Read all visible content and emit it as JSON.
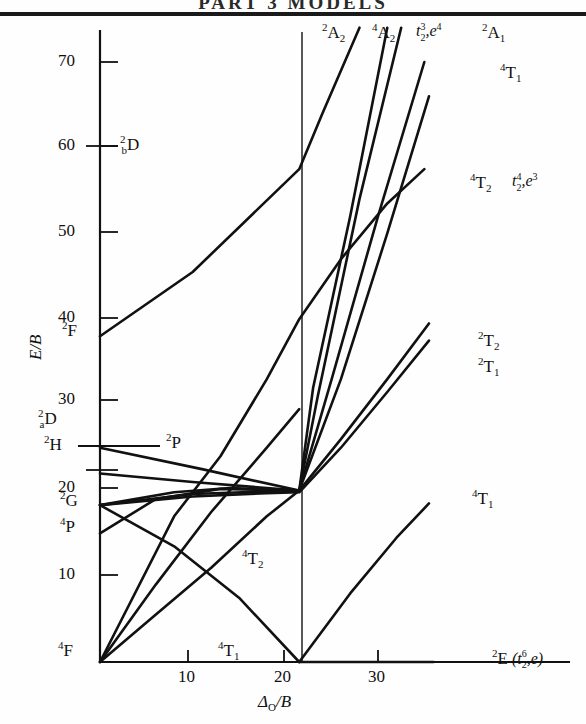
{
  "header": {
    "ghost_text": "PART 3   MODELS"
  },
  "chart_data": {
    "type": "line",
    "xlabel": "Δ_O/B",
    "ylabel": "E/B",
    "xlim": [
      0,
      36
    ],
    "ylim": [
      0,
      75
    ],
    "grid": false,
    "legend": "none",
    "xticks": [
      10,
      20,
      30
    ],
    "xtick_labels": [
      "10",
      "20",
      "30"
    ],
    "yticks": [
      10,
      20,
      30,
      40,
      50,
      60,
      70
    ],
    "ytick_labels": [
      "10",
      "20",
      "30",
      "40",
      "50",
      "60",
      "70"
    ],
    "crossover_x": 21.5,
    "free_ion_terms": [
      {
        "label": "2bD",
        "display_sup": "2",
        "display_sub": "b",
        "display_main": "D",
        "E": 60.0
      },
      {
        "label": "2F",
        "display_sup": "2",
        "display_sub": "",
        "display_main": "F",
        "E": 38.0
      },
      {
        "label": "2aD",
        "display_sup": "2",
        "display_sub": "a",
        "display_main": "D",
        "E": 25.0
      },
      {
        "label": "2H",
        "display_sup": "2",
        "display_sub": "",
        "display_main": "H",
        "E": 22.0
      },
      {
        "label": "2G",
        "display_sup": "2",
        "display_sub": "",
        "display_main": "G",
        "E": 18.3
      },
      {
        "label": "4P",
        "display_sup": "4",
        "display_sub": "",
        "display_main": "P",
        "E": 15.0
      },
      {
        "label": "4F",
        "display_sup": "4",
        "display_sub": "",
        "display_main": "F",
        "E": 0.0
      }
    ],
    "series": [
      {
        "name": "2A2-top",
        "points": [
          [
            0,
            18.3
          ],
          [
            8,
            19.8
          ],
          [
            14,
            20.3
          ],
          [
            21.5,
            20.0
          ],
          [
            23,
            32
          ],
          [
            27,
            52
          ],
          [
            31,
            74
          ]
        ]
      },
      {
        "name": "4A2-top",
        "points": [
          [
            0,
            15.0
          ],
          [
            6,
            19.0
          ],
          [
            13,
            20.2
          ],
          [
            21.5,
            20.0
          ],
          [
            23.5,
            31
          ],
          [
            28,
            54
          ],
          [
            32.5,
            74
          ]
        ]
      },
      {
        "name": "2F-line",
        "points": [
          [
            0,
            38.0
          ],
          [
            10,
            45.5
          ],
          [
            21.5,
            57.5
          ],
          [
            24,
            64
          ],
          [
            28,
            74
          ]
        ]
      },
      {
        "name": "2A1-line",
        "points": [
          [
            0,
            22.0
          ],
          [
            10,
            21.0
          ],
          [
            21.5,
            20.0
          ],
          [
            25,
            33
          ],
          [
            30,
            52
          ],
          [
            35,
            70
          ]
        ]
      },
      {
        "name": "4T1-upper",
        "points": [
          [
            0,
            25.0
          ],
          [
            11,
            22.5
          ],
          [
            21.5,
            20.0
          ],
          [
            26,
            33
          ],
          [
            31,
            50
          ],
          [
            35.5,
            66
          ]
        ]
      },
      {
        "name": "4T2-upper",
        "points": [
          [
            0,
            0.0
          ],
          [
            8,
            17.0
          ],
          [
            13,
            24.0
          ],
          [
            18,
            33.0
          ],
          [
            21.5,
            40.0
          ],
          [
            26,
            47
          ],
          [
            31,
            53.5
          ],
          [
            35,
            57.5
          ]
        ]
      },
      {
        "name": "2T2-line",
        "points": [
          [
            0,
            18.3
          ],
          [
            10,
            19.6
          ],
          [
            18,
            19.9
          ],
          [
            21.5,
            20.0
          ],
          [
            26,
            26
          ],
          [
            31,
            33
          ],
          [
            35.5,
            39.5
          ]
        ]
      },
      {
        "name": "2T1-line",
        "points": [
          [
            0,
            18.3
          ],
          [
            10,
            19.3
          ],
          [
            18,
            19.7
          ],
          [
            21.5,
            19.8
          ],
          [
            26,
            25
          ],
          [
            31,
            31.5
          ],
          [
            35.5,
            37.5
          ]
        ]
      },
      {
        "name": "4T2-lower",
        "points": [
          [
            0,
            0.0
          ],
          [
            6,
            9.0
          ],
          [
            12,
            17.5
          ],
          [
            18,
            25.0
          ],
          [
            21.5,
            29.5
          ]
        ]
      },
      {
        "name": "4T1-ground",
        "points": [
          [
            0,
            0.0
          ],
          [
            6,
            5.5
          ],
          [
            12,
            11.0
          ],
          [
            18,
            17.0
          ],
          [
            21.5,
            20.0
          ]
        ]
      },
      {
        "name": "4T1-descend",
        "points": [
          [
            0,
            18.3
          ],
          [
            8,
            13.5
          ],
          [
            15,
            7.5
          ],
          [
            21.5,
            0.0
          ]
        ]
      },
      {
        "name": "2E-ground",
        "points": [
          [
            21.5,
            0.0
          ],
          [
            36,
            0.0
          ]
        ]
      },
      {
        "name": "4T1-right",
        "points": [
          [
            21.5,
            0.0
          ],
          [
            27,
            8
          ],
          [
            32,
            14.5
          ],
          [
            35.5,
            18.5
          ]
        ]
      }
    ],
    "annotations": [
      {
        "id": "2A2-top",
        "sup": "2",
        "main": "A",
        "sub": "2",
        "cfg": ""
      },
      {
        "id": "4A2-top",
        "sup": "4",
        "main": "A",
        "sub": "2",
        "cfg": "t2-3,e-4"
      },
      {
        "id": "2A1-top",
        "sup": "2",
        "main": "A",
        "sub": "1",
        "cfg": ""
      },
      {
        "id": "4T1-top",
        "sup": "4",
        "main": "T",
        "sub": "1",
        "cfg": ""
      },
      {
        "id": "4T2-right",
        "sup": "4",
        "main": "T",
        "sub": "2",
        "cfg": "t2-4,e-3"
      },
      {
        "id": "2T2-right",
        "sup": "2",
        "main": "T",
        "sub": "2",
        "cfg": ""
      },
      {
        "id": "2T1-right",
        "sup": "2",
        "main": "T",
        "sub": "1",
        "cfg": ""
      },
      {
        "id": "4T1-right",
        "sup": "4",
        "main": "T",
        "sub": "1",
        "cfg": ""
      },
      {
        "id": "2P-left",
        "sup": "2",
        "main": "P",
        "sub": "",
        "cfg": ""
      },
      {
        "id": "4T2-mid",
        "sup": "4",
        "main": "T",
        "sub": "2",
        "cfg": ""
      },
      {
        "id": "4T1-bottom",
        "sup": "4",
        "main": "T",
        "sub": "1",
        "cfg": ""
      },
      {
        "id": "2E-ground",
        "sup": "2",
        "main": "E",
        "sub": "",
        "cfg": "t2-6,e"
      }
    ]
  },
  "labels": {
    "y_axis": "E/B",
    "x_axis_delta": "Δ",
    "x_axis_sub": "O",
    "x_axis_rest": "/B",
    "tick_70": "70",
    "tick_60": "60",
    "tick_50": "50",
    "tick_40": "40",
    "tick_30": "30",
    "tick_20": "20",
    "tick_10": "10",
    "xtick_10": "10",
    "xtick_20": "20",
    "xtick_30": "30",
    "term_2bD_sup": "2",
    "term_2bD_sub": "b",
    "term_2bD_main": "D",
    "term_2F_sup": "2",
    "term_2F_main": "F",
    "term_2aD_sup": "2",
    "term_2aD_sub": "a",
    "term_2aD_main": "D",
    "term_2H_sup": "2",
    "term_2H_main": "H",
    "term_2G_sup": "2",
    "term_2G_main": "G",
    "term_4P_sup": "4",
    "term_4P_main": "P",
    "term_4F_sup": "4",
    "term_4F_main": "F",
    "term_2P_sup": "2",
    "term_2P_main": "P",
    "ann_2A2_sup": "2",
    "ann_2A2_main": "A",
    "ann_2A2_sub": "2",
    "ann_4A2_sup": "4",
    "ann_4A2_main": "A",
    "ann_4A2_sub": "2",
    "cfg_t23e4_t": "t",
    "cfg_t23e4_sub": "2",
    "cfg_t23e4_sup": "3",
    "cfg_t23e4_e": "e",
    "cfg_t23e4_esup": "4",
    "ann_2A1_sup": "2",
    "ann_2A1_main": "A",
    "ann_2A1_sub": "1",
    "ann_4T1top_sup": "4",
    "ann_4T1top_main": "T",
    "ann_4T1top_sub": "1",
    "ann_4T2r_sup": "4",
    "ann_4T2r_main": "T",
    "ann_4T2r_sub": "2",
    "cfg_t24e3_t": "t",
    "cfg_t24e3_sub": "2",
    "cfg_t24e3_sup": "4",
    "cfg_t24e3_e": "e",
    "cfg_t24e3_esup": "3",
    "ann_2T2_sup": "2",
    "ann_2T2_main": "T",
    "ann_2T2_sub": "2",
    "ann_2T1_sup": "2",
    "ann_2T1_main": "T",
    "ann_2T1_sub": "1",
    "ann_4T1r_sup": "4",
    "ann_4T1r_main": "T",
    "ann_4T1r_sub": "1",
    "ann_4T2mid_sup": "4",
    "ann_4T2mid_main": "T",
    "ann_4T2mid_sub": "2",
    "ann_4T1bot_sup": "4",
    "ann_4T1bot_main": "T",
    "ann_4T1bot_sub": "1",
    "ann_2E_sup": "2",
    "ann_2E_main": "E",
    "cfg_t26e_open": "(",
    "cfg_t26e_t": "t",
    "cfg_t26e_sub": "2",
    "cfg_t26e_sup": "6",
    "cfg_t26e_comma": ",",
    "cfg_t26e_e": "e",
    "cfg_t26e_close": ")"
  },
  "colors": {
    "line": "#111111",
    "axis": "#111111",
    "background": "#ffffff"
  }
}
